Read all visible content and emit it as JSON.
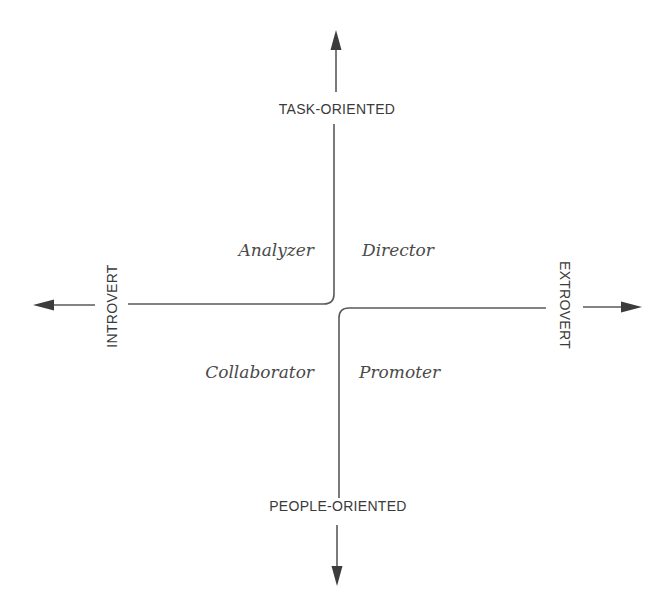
{
  "diagram": {
    "type": "quadrant",
    "axes": {
      "top": "TASK-ORIENTED",
      "bottom": "PEOPLE-ORIENTED",
      "left": "INTROVERT",
      "right": "EXTROVERT"
    },
    "quadrants": {
      "top_left": "Analyzer",
      "top_right": "Director",
      "bottom_left": "Collaborator",
      "bottom_right": "Promoter"
    },
    "colors": {
      "line": "#5a5a5a",
      "arrowhead": "#3c3c3c",
      "text": "#3a3a3a"
    }
  }
}
